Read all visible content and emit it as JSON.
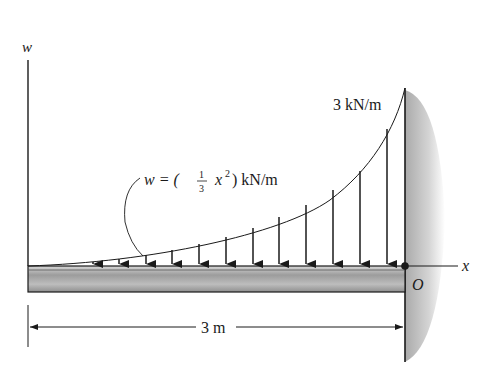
{
  "figure": {
    "type": "distributed-load-cantilever-beam",
    "axes": {
      "vertical_label": "w",
      "horizontal_label": "x",
      "origin_label": "O"
    },
    "load": {
      "max_label": "3 kN/m",
      "equation": {
        "lhs": "w = (",
        "frac_num": "1",
        "frac_den": "3",
        "var": "x",
        "exp": "2",
        "rhs": ") kN/m"
      },
      "arrow_count": 12
    },
    "dimension": {
      "length_label": "3 m"
    },
    "colors": {
      "line": "#1a1a1a",
      "beam_fill": "#a8a8a8",
      "wall_fill": "#bdbdbd"
    }
  }
}
